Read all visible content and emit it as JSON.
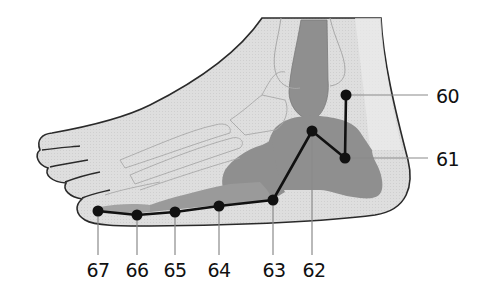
{
  "diagram": {
    "colors": {
      "skin": "#dcdcdc",
      "bone_light": "#e6e6e6",
      "bone_dark": "#8f8f8f",
      "outline": "#2a2a2a",
      "bone_outline": "#a8a8a8",
      "meridian": "#111111",
      "leader": "#8a8a8a"
    },
    "points": [
      {
        "id": "60",
        "label": "60",
        "x": 346,
        "y": 95,
        "label_x": 436,
        "label_y": 95,
        "leader": "horizontal"
      },
      {
        "id": "61",
        "label": "61",
        "x": 345,
        "y": 158,
        "label_x": 436,
        "label_y": 158,
        "leader": "horizontal"
      },
      {
        "id": "62",
        "label": "62",
        "x": 312,
        "y": 131,
        "label_x": 312,
        "label_y": 262,
        "leader": "vertical"
      },
      {
        "id": "63",
        "label": "63",
        "x": 273,
        "y": 200,
        "label_x": 273,
        "label_y": 262,
        "leader": "vertical"
      },
      {
        "id": "64",
        "label": "64",
        "x": 219,
        "y": 206,
        "label_x": 219,
        "label_y": 262,
        "leader": "vertical"
      },
      {
        "id": "65",
        "label": "65",
        "x": 175,
        "y": 212,
        "label_x": 175,
        "label_y": 262,
        "leader": "vertical"
      },
      {
        "id": "66",
        "label": "66",
        "x": 137,
        "y": 215,
        "label_x": 137,
        "label_y": 262,
        "leader": "vertical"
      },
      {
        "id": "67",
        "label": "67",
        "x": 98,
        "y": 211,
        "label_x": 98,
        "label_y": 262,
        "leader": "vertical"
      }
    ],
    "meridian_path_order": [
      "60",
      "61",
      "62",
      "63",
      "64",
      "65",
      "66",
      "67"
    ]
  }
}
